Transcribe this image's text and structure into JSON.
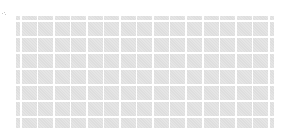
{
  "canvas": {
    "width": 287,
    "height": 135,
    "background": "#ffffff"
  },
  "tile_grid": {
    "description": "grid of light gray placeholder tiles",
    "tile_color": "#e2e2e2",
    "gap_color": "#ffffff",
    "columns": 17,
    "rows": 8,
    "full_columns": 15,
    "full_rows": 6,
    "partial_edges": [
      "left",
      "right",
      "top",
      "bottom"
    ]
  },
  "corner_mark": {
    "icon": "speck-icon",
    "color": "#c8c8c8"
  }
}
